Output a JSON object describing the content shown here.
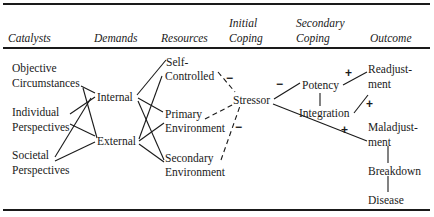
{
  "headers": {
    "catalysts": "Catalysts",
    "demands": "Demands",
    "resources": "Resources",
    "initial_coping": [
      "Initial",
      "Coping"
    ],
    "secondary_coping": [
      "Secondary",
      "Coping"
    ],
    "outcome": "Outcome"
  },
  "catalysts": {
    "objective": [
      "Objective",
      "Circumstances"
    ],
    "individual": [
      "Individual",
      "Perspectives"
    ],
    "societal": [
      "Societal",
      "Perspectives"
    ]
  },
  "demands": {
    "internal": "Internal",
    "external": "External"
  },
  "resources": {
    "self_controlled": [
      "Self-",
      "Controlled"
    ],
    "primary": [
      "Primary",
      "Environment"
    ],
    "secondary": [
      "Secondary",
      "Environment"
    ]
  },
  "initial_coping": {
    "stressor": "Stressor"
  },
  "secondary_coping": {
    "potency": "Potency",
    "integration": "Integration"
  },
  "outcome": {
    "readjustment": [
      "Readjust-",
      "ment"
    ],
    "maladjustment": [
      "Maladjust-",
      "ment"
    ],
    "breakdown": "Breakdown",
    "disease": "Disease"
  },
  "signs": {
    "self_to_stressor": "−",
    "primary_to_stressor": "−",
    "stressor_to_potency": "−",
    "potency_to_readjustment": "+",
    "integration_to_readjustment": "+",
    "stressor_to_maladjustment": "+"
  }
}
